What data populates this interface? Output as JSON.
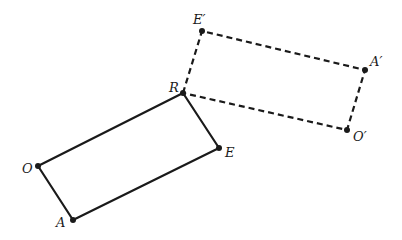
{
  "diagram": {
    "type": "geometric-transformation",
    "background": "#ffffff",
    "stroke_color": "#1a1a1a",
    "original_figure": {
      "name": "ROAE",
      "style": "solid",
      "stroke_width": 2.2,
      "vertices": [
        {
          "id": "R",
          "label": "R",
          "x": 183,
          "y": 93,
          "label_x": 169,
          "label_y": 92
        },
        {
          "id": "E",
          "label": "E",
          "x": 219,
          "y": 148,
          "label_x": 225,
          "label_y": 157
        },
        {
          "id": "A",
          "label": "A",
          "x": 73,
          "y": 220,
          "label_x": 56,
          "label_y": 227
        },
        {
          "id": "O",
          "label": "O",
          "x": 38,
          "y": 166,
          "label_x": 22,
          "label_y": 173
        }
      ]
    },
    "image_figure": {
      "name": "RE'A'O'",
      "style": "dashed",
      "stroke_width": 2.2,
      "dash": "6 4",
      "vertices": [
        {
          "id": "R",
          "label": "",
          "x": 183,
          "y": 93
        },
        {
          "id": "E'",
          "label": "E′",
          "x": 202,
          "y": 31,
          "label_x": 193,
          "label_y": 24
        },
        {
          "id": "A'",
          "label": "A′",
          "x": 365,
          "y": 70,
          "label_x": 370,
          "label_y": 66
        },
        {
          "id": "O'",
          "label": "O′",
          "x": 347,
          "y": 130,
          "label_x": 353,
          "label_y": 141
        }
      ]
    }
  }
}
